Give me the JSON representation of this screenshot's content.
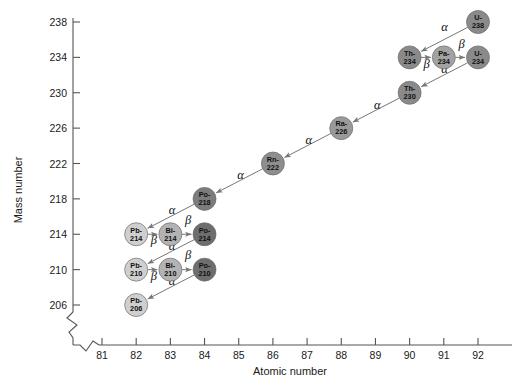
{
  "chart_data": {
    "type": "scatter",
    "title": "",
    "xlabel": "Atomic number",
    "ylabel": "Mass number",
    "xlim": [
      80.4,
      92.6
    ],
    "ylim": [
      204.2,
      239.2
    ],
    "xticks": [
      81,
      82,
      83,
      84,
      85,
      86,
      87,
      88,
      89,
      90,
      91,
      92
    ],
    "yticks": [
      206,
      210,
      214,
      218,
      222,
      226,
      230,
      234,
      238
    ],
    "grid": false,
    "legend": "none",
    "axis_break": true,
    "nodes": [
      {
        "id": "U-238",
        "label_top": "U-",
        "label_bottom": "238",
        "element": "U",
        "x": 92,
        "y": 238,
        "fill": "#8a8a8a"
      },
      {
        "id": "Th-234",
        "label_top": "Th-",
        "label_bottom": "234",
        "element": "Th",
        "x": 90,
        "y": 234,
        "fill": "#8a8a8a"
      },
      {
        "id": "Pa-234",
        "label_top": "Pa-",
        "label_bottom": "234",
        "element": "Pa",
        "x": 91,
        "y": 234,
        "fill": "#a2a2a2"
      },
      {
        "id": "U-234",
        "label_top": "U-",
        "label_bottom": "234",
        "element": "U",
        "x": 92,
        "y": 234,
        "fill": "#8a8a8a"
      },
      {
        "id": "Th-230",
        "label_top": "Th-",
        "label_bottom": "230",
        "element": "Th",
        "x": 90,
        "y": 230,
        "fill": "#8a8a8a"
      },
      {
        "id": "Ra-226",
        "label_top": "Ra-",
        "label_bottom": "226",
        "element": "Ra",
        "x": 88,
        "y": 226,
        "fill": "#9a9a9a"
      },
      {
        "id": "Rn-222",
        "label_top": "Rn-",
        "label_bottom": "222",
        "element": "Rn",
        "x": 86,
        "y": 222,
        "fill": "#8e8e8e"
      },
      {
        "id": "Po-218",
        "label_top": "Po-",
        "label_bottom": "218",
        "element": "Po",
        "x": 84,
        "y": 218,
        "fill": "#7c7c7c"
      },
      {
        "id": "Pb-214",
        "label_top": "Pb-",
        "label_bottom": "214",
        "element": "Pb",
        "x": 82,
        "y": 214,
        "fill": "#cfcfcf"
      },
      {
        "id": "Bi-214",
        "label_top": "Bi-",
        "label_bottom": "214",
        "element": "Bi",
        "x": 83,
        "y": 214,
        "fill": "#b3b3b3"
      },
      {
        "id": "Po-214",
        "label_top": "Po-",
        "label_bottom": "214",
        "element": "Po",
        "x": 84,
        "y": 214,
        "fill": "#6e6e6e"
      },
      {
        "id": "Pb-210",
        "label_top": "Pb-",
        "label_bottom": "210",
        "element": "Pb",
        "x": 82,
        "y": 210,
        "fill": "#cfcfcf"
      },
      {
        "id": "Bi-210",
        "label_top": "Bi-",
        "label_bottom": "210",
        "element": "Bi",
        "x": 83,
        "y": 210,
        "fill": "#b3b3b3"
      },
      {
        "id": "Po-210",
        "label_top": "Po-",
        "label_bottom": "210",
        "element": "Po",
        "x": 84,
        "y": 210,
        "fill": "#6e6e6e"
      },
      {
        "id": "Pb-206",
        "label_top": "Pb-",
        "label_bottom": "206",
        "element": "Pb",
        "x": 82,
        "y": 206,
        "fill": "#cfcfcf"
      }
    ],
    "decays": [
      {
        "from": "U-238",
        "to": "Th-234",
        "type": "alpha",
        "label": "α",
        "lx": 91.02,
        "ly": 236.95
      },
      {
        "from": "Th-234",
        "to": "Pa-234",
        "type": "beta",
        "label": "β",
        "lx": 90.5,
        "ly": 232.85
      },
      {
        "from": "Pa-234",
        "to": "U-234",
        "type": "beta",
        "label": "β",
        "lx": 91.52,
        "ly": 235.1
      },
      {
        "from": "U-234",
        "to": "Th-230",
        "type": "alpha",
        "label": "α",
        "lx": 91.02,
        "ly": 232.2
      },
      {
        "from": "Th-230",
        "to": "Ra-226",
        "type": "alpha",
        "label": "α",
        "lx": 89.05,
        "ly": 228.2
      },
      {
        "from": "Ra-226",
        "to": "Rn-222",
        "type": "alpha",
        "label": "α",
        "lx": 87.05,
        "ly": 224.25
      },
      {
        "from": "Rn-222",
        "to": "Po-218",
        "type": "alpha",
        "label": "α",
        "lx": 85.05,
        "ly": 220.25
      },
      {
        "from": "Po-218",
        "to": "Pb-214",
        "type": "alpha",
        "label": "α",
        "lx": 83.05,
        "ly": 216.25
      },
      {
        "from": "Pb-214",
        "to": "Bi-214",
        "type": "beta",
        "label": "β",
        "lx": 82.52,
        "ly": 212.85
      },
      {
        "from": "Bi-214",
        "to": "Po-214",
        "type": "beta",
        "label": "β",
        "lx": 83.52,
        "ly": 215.15
      },
      {
        "from": "Po-214",
        "to": "Pb-210",
        "type": "alpha",
        "label": "α",
        "lx": 83.05,
        "ly": 212.25
      },
      {
        "from": "Pb-210",
        "to": "Bi-210",
        "type": "beta",
        "label": "β",
        "lx": 82.52,
        "ly": 208.85
      },
      {
        "from": "Bi-210",
        "to": "Po-210",
        "type": "beta",
        "label": "β",
        "lx": 83.52,
        "ly": 211.15
      },
      {
        "from": "Po-210",
        "to": "Pb-206",
        "type": "alpha",
        "label": "α",
        "lx": 83.05,
        "ly": 208.25
      }
    ]
  }
}
